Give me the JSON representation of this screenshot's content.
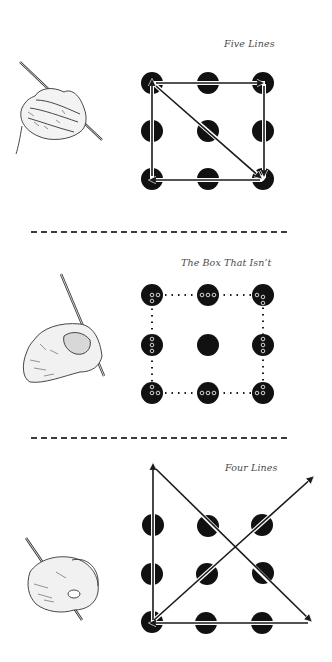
{
  "panels": [
    {
      "title": "Five Lines",
      "solution_lines": 5,
      "grid": "3x3",
      "connector_style": "solid-arrows"
    },
    {
      "title": "The Box That Isn’t",
      "solution_lines": 0,
      "grid": "3x3",
      "connector_style": "dotted-box"
    },
    {
      "title": "Four Lines",
      "solution_lines": 4,
      "grid": "3x3",
      "connector_style": "solid-arrows-extending-outside"
    }
  ],
  "icons": {
    "hand": "hand-holding-pencil-icon"
  },
  "colors": {
    "dot": "#111111",
    "line": "#1a1a1a",
    "title": "#4a4a4a",
    "background": "#ffffff"
  }
}
